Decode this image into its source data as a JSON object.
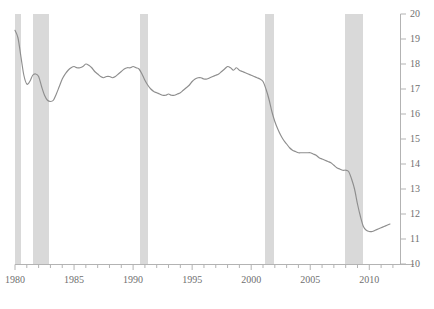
{
  "chart_data": {
    "type": "line",
    "title": "",
    "subtitle": "",
    "xlabel": "",
    "ylabel": "",
    "xlim": [
      1980,
      2012.6
    ],
    "ylim": [
      10,
      20
    ],
    "grid": false,
    "legend": "none",
    "y_ticks": [
      10,
      11,
      12,
      13,
      14,
      15,
      16,
      17,
      18,
      19,
      20
    ],
    "y_tick_labels": [
      "10",
      "11",
      "12",
      "13",
      "14",
      "15",
      "16",
      "17",
      "18",
      "19",
      "20"
    ],
    "x_ticks_major": [
      1980,
      1985,
      1990,
      1995,
      2000,
      2005,
      2010
    ],
    "x_tick_labels": [
      "1980",
      "1985",
      "1990",
      "1995",
      "2000",
      "2005",
      "2010"
    ],
    "x_ticks_minor_step": 1,
    "line_color": "#8e8e8e",
    "band_color": "#d9d9d9",
    "axis_color": "#b3b3b3",
    "background_color": "#ffffff",
    "shaded_regions": [
      {
        "label": "recession-1980",
        "start": 1980.0,
        "end": 1980.55
      },
      {
        "label": "recession-1981-1982",
        "start": 1981.55,
        "end": 1982.92
      },
      {
        "label": "recession-1990-1991",
        "start": 1990.55,
        "end": 1991.25
      },
      {
        "label": "recession-2001",
        "start": 2001.2,
        "end": 2001.92
      },
      {
        "label": "recession-2007-2009",
        "start": 2007.95,
        "end": 2009.5
      }
    ],
    "series": [
      {
        "name": "series-1",
        "x": [
          1980.0,
          1980.25,
          1980.5,
          1980.75,
          1981.0,
          1981.25,
          1981.5,
          1981.75,
          1982.0,
          1982.25,
          1982.5,
          1982.75,
          1983.0,
          1983.25,
          1983.5,
          1983.75,
          1984.0,
          1984.25,
          1984.5,
          1984.75,
          1985.0,
          1985.25,
          1985.5,
          1985.75,
          1986.0,
          1986.25,
          1986.5,
          1986.75,
          1987.0,
          1987.25,
          1987.5,
          1987.75,
          1988.0,
          1988.25,
          1988.5,
          1988.75,
          1989.0,
          1989.25,
          1989.5,
          1989.75,
          1990.0,
          1990.25,
          1990.5,
          1990.75,
          1991.0,
          1991.25,
          1991.5,
          1991.75,
          1992.0,
          1992.25,
          1992.5,
          1992.75,
          1993.0,
          1993.25,
          1993.5,
          1993.75,
          1994.0,
          1994.25,
          1994.5,
          1994.75,
          1995.0,
          1995.25,
          1995.5,
          1995.75,
          1996.0,
          1996.25,
          1996.5,
          1996.75,
          1997.0,
          1997.25,
          1997.5,
          1997.75,
          1998.0,
          1998.25,
          1998.5,
          1998.75,
          1999.0,
          1999.25,
          1999.5,
          1999.75,
          2000.0,
          2000.25,
          2000.5,
          2000.75,
          2001.0,
          2001.25,
          2001.5,
          2001.75,
          2002.0,
          2002.25,
          2002.5,
          2002.75,
          2003.0,
          2003.25,
          2003.5,
          2003.75,
          2004.0,
          2004.25,
          2004.5,
          2004.75,
          2005.0,
          2005.25,
          2005.5,
          2005.75,
          2006.0,
          2006.25,
          2006.5,
          2006.75,
          2007.0,
          2007.25,
          2007.5,
          2007.75,
          2008.0,
          2008.25,
          2008.5,
          2008.75,
          2009.0,
          2009.25,
          2009.5,
          2009.75,
          2010.0,
          2010.25,
          2010.5,
          2010.75,
          2011.0,
          2011.25,
          2011.5,
          2011.75
        ],
        "y": [
          19.35,
          19.05,
          18.3,
          17.55,
          17.2,
          17.3,
          17.55,
          17.6,
          17.5,
          17.1,
          16.75,
          16.55,
          16.5,
          16.55,
          16.8,
          17.1,
          17.4,
          17.6,
          17.75,
          17.85,
          17.9,
          17.85,
          17.85,
          17.9,
          18.0,
          17.95,
          17.85,
          17.7,
          17.6,
          17.5,
          17.45,
          17.5,
          17.5,
          17.45,
          17.5,
          17.6,
          17.7,
          17.8,
          17.85,
          17.85,
          17.9,
          17.85,
          17.8,
          17.6,
          17.35,
          17.15,
          17.0,
          16.9,
          16.85,
          16.8,
          16.75,
          16.75,
          16.8,
          16.75,
          16.75,
          16.8,
          16.85,
          16.95,
          17.05,
          17.15,
          17.3,
          17.4,
          17.45,
          17.45,
          17.4,
          17.4,
          17.45,
          17.5,
          17.55,
          17.6,
          17.7,
          17.8,
          17.9,
          17.85,
          17.75,
          17.85,
          17.75,
          17.7,
          17.65,
          17.6,
          17.55,
          17.5,
          17.45,
          17.4,
          17.3,
          17.0,
          16.6,
          16.1,
          15.7,
          15.4,
          15.15,
          14.95,
          14.8,
          14.65,
          14.55,
          14.5,
          14.45,
          14.45,
          14.45,
          14.45,
          14.45,
          14.4,
          14.35,
          14.25,
          14.2,
          14.15,
          14.1,
          14.05,
          13.95,
          13.85,
          13.8,
          13.75,
          13.75,
          13.7,
          13.4,
          13.0,
          12.4,
          11.9,
          11.5,
          11.35,
          11.3,
          11.3,
          11.35,
          11.4,
          11.45,
          11.5,
          11.55,
          11.6
        ]
      }
    ]
  }
}
